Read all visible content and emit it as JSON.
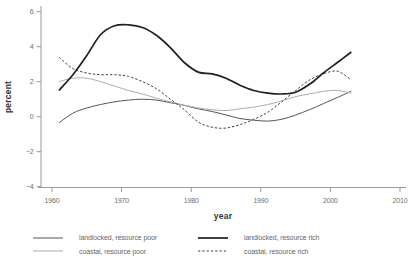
{
  "chart_data": {
    "type": "line",
    "title": "",
    "xlabel": "year",
    "ylabel": "percent",
    "xlim": [
      1958.4,
      2010.9
    ],
    "ylim": [
      -4.1,
      6.4
    ],
    "x_ticks": [
      1960,
      1970,
      1980,
      1990,
      2000,
      2010
    ],
    "x_tick_labels": [
      "1960",
      "1970",
      "1980",
      "1990",
      "2000",
      "2010"
    ],
    "y_ticks": [
      -4,
      -2,
      0,
      2,
      4,
      6
    ],
    "y_tick_labels": [
      "−4",
      "−2",
      "0",
      "2",
      "4",
      "6"
    ],
    "grid": false,
    "legend_position": "below chart, two columns",
    "x": [
      1961,
      1963,
      1965,
      1967,
      1969,
      1971,
      1973,
      1975,
      1977,
      1979,
      1981,
      1983,
      1985,
      1987,
      1989,
      1991,
      1993,
      1995,
      1997,
      1999,
      2001,
      2003
    ],
    "series": [
      {
        "name": "landlocked, resource poor",
        "line_style": "solid",
        "line_width": 1,
        "color": "#555555",
        "values": [
          -0.35,
          0.2,
          0.5,
          0.7,
          0.85,
          0.95,
          1.0,
          0.95,
          0.8,
          0.65,
          0.45,
          0.3,
          0.1,
          -0.1,
          -0.2,
          -0.25,
          -0.15,
          0.1,
          0.4,
          0.75,
          1.1,
          1.45
        ]
      },
      {
        "name": "coastal, resource poor",
        "line_style": "solid",
        "line_width": 1,
        "color": "#ababab",
        "values": [
          2.0,
          2.2,
          2.2,
          2.0,
          1.75,
          1.5,
          1.3,
          1.05,
          0.85,
          0.65,
          0.5,
          0.4,
          0.35,
          0.45,
          0.55,
          0.7,
          0.9,
          1.15,
          1.3,
          1.45,
          1.5,
          1.35
        ]
      },
      {
        "name": "landlocked, resource rich",
        "line_style": "solid",
        "line_width": 1.7,
        "color": "#1f1f1f",
        "values": [
          1.5,
          2.4,
          3.5,
          4.7,
          5.2,
          5.25,
          5.1,
          4.65,
          3.95,
          3.1,
          2.55,
          2.45,
          2.2,
          1.8,
          1.5,
          1.35,
          1.3,
          1.4,
          1.85,
          2.5,
          3.1,
          3.7
        ]
      },
      {
        "name": "coastal, resource rich",
        "line_style": "dashed",
        "line_width": 1,
        "color": "#404040",
        "values": [
          3.4,
          2.75,
          2.5,
          2.4,
          2.4,
          2.3,
          2.0,
          1.6,
          1.0,
          0.4,
          -0.3,
          -0.6,
          -0.65,
          -0.45,
          -0.15,
          0.25,
          0.85,
          1.5,
          2.1,
          2.45,
          2.6,
          2.1
        ]
      }
    ]
  },
  "colors": {
    "axis": "#9a9a9a",
    "tick_text": "#6e6e6e",
    "axis_title_text": "#333333",
    "legend_text": "#666666",
    "background": "#ffffff"
  }
}
